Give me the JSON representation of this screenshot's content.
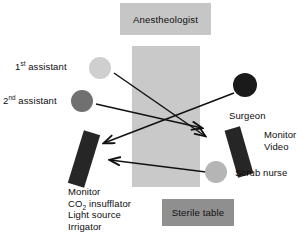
{
  "diagram": {
    "colors": {
      "operating_table_band": "#c9c9c9",
      "anesthesiologist_box": "#c6c6c6",
      "sterile_table_box": "#8f8f8f",
      "first_assistant_circle": "#cfcfcf",
      "second_assistant_circle": "#707070",
      "surgeon_circle": "#1a1a1a",
      "scrub_nurse_circle": "#b5b5b5",
      "monitor_left_rect": "#262626",
      "monitor_right_rect": "#262626",
      "arrow_line": "#111111",
      "text": "#0d0d0d",
      "background": "#ffffff"
    },
    "boxes": {
      "anesthesiologist": "Anestheologist",
      "sterile_table": "Sterile table"
    },
    "labels": {
      "first_assistant_ordinal": "1",
      "first_assistant_suffix": "st",
      "first_assistant_text": " assistant",
      "second_assistant_ordinal": "2",
      "second_assistant_suffix": "nd",
      "second_assistant_text": " assistant",
      "surgeon": "Surgeon",
      "scrub_nurse": "Scrub nurse",
      "monitor": "Monitor",
      "video": "Video"
    },
    "equipment_list": {
      "line1": "Monitor",
      "line2_prefix": "CO",
      "line2_sub": "2",
      "line2_suffix": " insufflator",
      "line3": "Light source",
      "line4": "Irrigator"
    },
    "shapes": {
      "operating_table": {
        "x": 132,
        "y": 46,
        "w": 68,
        "h": 141
      },
      "first_assistant": {
        "cx": 100,
        "cy": 68,
        "r": 11
      },
      "second_assistant": {
        "cx": 82,
        "cy": 101,
        "r": 11
      },
      "surgeon": {
        "cx": 245,
        "cy": 85,
        "r": 12
      },
      "scrub_nurse": {
        "cx": 216,
        "cy": 172,
        "r": 11
      },
      "monitor_left": {
        "cx": 84,
        "cy": 159,
        "w": 17,
        "h": 55,
        "rotate": 17
      },
      "monitor_right": {
        "cx": 239,
        "cy": 152,
        "w": 16,
        "h": 49,
        "rotate": -16
      }
    },
    "arrows": [
      {
        "name": "first-assistant-to-monitor-video",
        "x1": 114,
        "y1": 73,
        "x2": 205,
        "y2": 136
      },
      {
        "name": "second-assistant-to-monitor-video",
        "x1": 96,
        "y1": 104,
        "x2": 202,
        "y2": 128
      },
      {
        "name": "surgeon-to-left-monitor",
        "x1": 234,
        "y1": 93,
        "x2": 104,
        "y2": 143
      },
      {
        "name": "scrub-nurse-to-left-monitor",
        "x1": 206,
        "y1": 172,
        "x2": 110,
        "y2": 160
      }
    ]
  }
}
